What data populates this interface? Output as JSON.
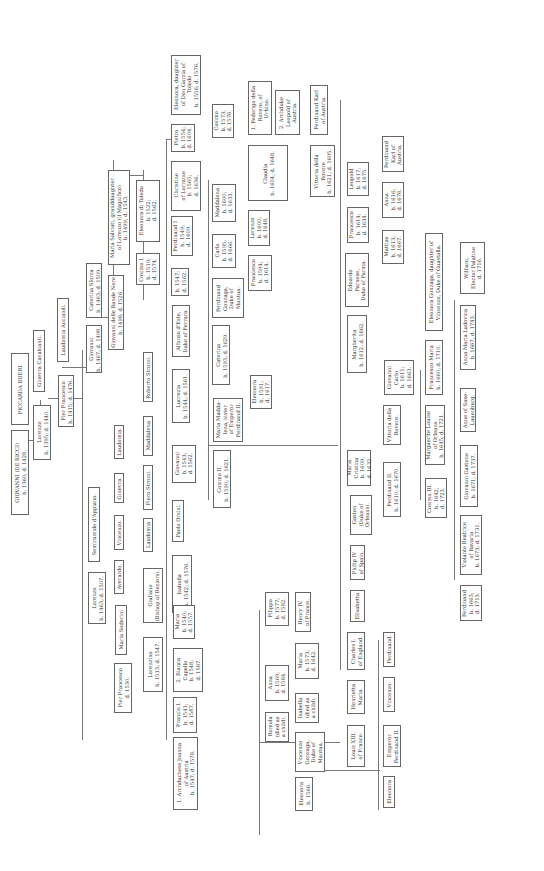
{
  "orientation": "rotated 90 degrees counter-clockwise (text reads bottom-to-top)",
  "persons": [
    {
      "id": "giovanni_bicci",
      "text": "GIOVANNI (DE BICCI)\nb. 1360; d. 1428."
    },
    {
      "id": "piccarda",
      "text": "PICCARDA BUERI."
    },
    {
      "id": "lorenzo_1395",
      "text": "Lorenzo\nb. 1395; d. 1440."
    },
    {
      "id": "ginevra_cavalcanti",
      "text": "Ginevra Cavalcanti."
    },
    {
      "id": "pier_francesco_1415",
      "text": "Pier Francesco\nb. 1415; d. 1476."
    },
    {
      "id": "laudomia_acciaioli",
      "text": "Laudomia Acciaioli."
    },
    {
      "id": "giovanni_1467",
      "text": "Giovanni\nb. 1467; d. 1498."
    },
    {
      "id": "caterina_sforza",
      "text": "Caterina Sforza\nb. 1463; d. 1509."
    },
    {
      "id": "giovanni_bande_nere",
      "text": "Giovanni delle Bande Nere\nb. 1498; d. 1526."
    },
    {
      "id": "maria_salviati",
      "text": "Maria Salviati, granddaughter\nof Lorenzo (il Magnifico)\nb. 1499; d. 1543."
    },
    {
      "id": "cosimo_1",
      "text": "Cosimo I.\nb. 1519;\nd. 1574."
    },
    {
      "id": "eleonora_toledo",
      "text": "Eleonora di Toledo\nb. 1522;\nd. 1562."
    },
    {
      "id": "child_1547",
      "text": "b. 1547;\nd. 1562."
    },
    {
      "id": "ferdinand_1",
      "text": "Ferdinand I\nb. 1549;\nd. 1609."
    },
    {
      "id": "christine_lorraine",
      "text": "Christine\nof Lorraine\nb. 1565;\nd. 1636."
    },
    {
      "id": "pietro",
      "text": "Pietro\nb. 1554;\nd. 1604."
    },
    {
      "id": "eleonora_garzia",
      "text": "Eleonora, daughter\nof Don Garzia of\nToledo\nb. 1556; d. 1576."
    },
    {
      "id": "cosimo_1573",
      "text": "Cosimo\nb. 1573;\nd. 1576."
    },
    {
      "id": "maddalena_1600",
      "text": "Maddalena\nb. 1600;\nd. 1633."
    },
    {
      "id": "claudia",
      "text": "Claudia\nb. 1604; d. 1648."
    },
    {
      "id": "federigo_rovere",
      "text": "1. Federigo della\nRovere, of\nUrbino."
    },
    {
      "id": "leopold_austria",
      "text": "2. Archduke\nLeopold of\nAustria."
    },
    {
      "id": "ferdinand_karl_1",
      "text": "Ferdinand Karl\nof Austria."
    },
    {
      "id": "vittoria_rovere_1621",
      "text": "Vittoria della\nRovere\nb. 1621; d. 1695."
    },
    {
      "id": "lorenzo_1600",
      "text": "Lorenzo\nb. 1600;\nd. 1648."
    },
    {
      "id": "carlo",
      "text": "Carlo\nb. 1595;\nd. 1666."
    },
    {
      "id": "francesco_1594",
      "text": "Francesco\nb. 1594;\nd. 1614."
    },
    {
      "id": "ferdinand_gonzaga",
      "text": "Ferdinand\nGonzaga,\nDuke of\nMantua."
    },
    {
      "id": "caterina_1593",
      "text": "Caterina\nb. 1593; d. 1629."
    },
    {
      "id": "eleonora_1591",
      "text": "Eleonora\nb. 1591;\nd. 1617."
    },
    {
      "id": "leopold_1617",
      "text": "Leopold\nb. 1617;\nd. 1675."
    },
    {
      "id": "francesco_1614",
      "text": "Francesco\nb. 1614;\nd. 1634."
    },
    {
      "id": "anna_1616",
      "text": "Anna\nb. 1616;\nd. 1676."
    },
    {
      "id": "ferdinand_karl_2",
      "text": "Ferdinand\nKarl of\nAustria."
    },
    {
      "id": "mattias",
      "text": "Mattias\nb. 1613;\nd. 1667."
    },
    {
      "id": "edoardo_farnese",
      "text": "Edoardo\nFarnese,\nDuke of Parma."
    },
    {
      "id": "margherita",
      "text": "Margherita\nb. 1612; d. 1662."
    },
    {
      "id": "giovanni_carlo",
      "text": "Giovanni\nCarlo\nb. 1611;\nd. 1663."
    },
    {
      "id": "francesco_maria",
      "text": "Francesco Maria\nb. 1660; d. 1710."
    },
    {
      "id": "eleonora_gonzaga",
      "text": "Eleonora Gonzaga, daughter of\nVincenzo, Duke of Guastalla."
    },
    {
      "id": "william_palatine",
      "text": "William,\nElector Palatine\nd. 1716."
    },
    {
      "id": "anna_maria_ludovica",
      "text": "Anna Maria Ludovica\nb. 1667; d. 1743."
    },
    {
      "id": "anne_saxe",
      "text": "Anne of Saxe-\nLauenburg."
    },
    {
      "id": "gian_gastone",
      "text": "Giovanni Gastone\nb. 1671; d. 1737."
    },
    {
      "id": "marguerite_orleans",
      "text": "Marguerite Louise\nof Orleans\nb. 1645; d. 1721."
    },
    {
      "id": "cosimo_3",
      "text": "Cosimo III.\nb. 1642;\nd. 1723."
    },
    {
      "id": "violante",
      "text": "Violante Beatrice\nof Bavaria\nb. 1673; d. 1731."
    },
    {
      "id": "ferdinand_1663",
      "text": "Ferdinand\nb. 1663;\nd. 1713."
    },
    {
      "id": "vittoria_rovere_2",
      "text": "Vittoria della\nRovere."
    },
    {
      "id": "ferdinand_2",
      "text": "Ferdinand II.\nb. 1610; d. 1670."
    },
    {
      "id": "maria_cristina",
      "text": "Maria\nCristina\nb. 1609;\nd. 1632."
    },
    {
      "id": "gaston",
      "text": "Gaston\n(Duke of\nOrleans)."
    },
    {
      "id": "philip_4",
      "text": "Philip IV\nof Spain."
    },
    {
      "id": "elisabetta",
      "text": "Elisabetta"
    },
    {
      "id": "charles_1",
      "text": "Charles I.\nof England."
    },
    {
      "id": "henrietta_maria",
      "text": "Henrietta\nMaria."
    },
    {
      "id": "louis_13",
      "text": "Louis XIII.\nof France."
    },
    {
      "id": "ferdinand_x",
      "text": "Ferdinand."
    },
    {
      "id": "vincenzo_x",
      "text": "Vincenzo."
    },
    {
      "id": "emperor_ferdinand_2",
      "text": "Emperor\nFerdinand II."
    },
    {
      "id": "eleonora_x",
      "text": "Eleonora"
    },
    {
      "id": "cosimo_2",
      "text": "Cosimo II.\nb. 1590; d. 1621."
    },
    {
      "id": "maria_maddalena",
      "text": "Maria Madda-\nlena, sister\nof Emperor\nFerdinand II."
    },
    {
      "id": "lucrezia",
      "text": "Lucrezia\nb. 1544; d. 1561."
    },
    {
      "id": "alfonso_este",
      "text": "Alfonso d'Este,\nDuke of Ferrara."
    },
    {
      "id": "giovanni_1543",
      "text": "Giovanni\nb. 1543;\nd. 1562."
    },
    {
      "id": "roberto_strozzi",
      "text": "Roberto Strozzi."
    },
    {
      "id": "maddalena",
      "text": "Maddalena"
    },
    {
      "id": "piero_strozzi",
      "text": "Piero Strozzi."
    },
    {
      "id": "laudomia_1",
      "text": "Laudomia"
    },
    {
      "id": "paolo_orsini",
      "text": "Paolo Orsini."
    },
    {
      "id": "isabella_1542",
      "text": "Isabella\nb. 1542; d. 1576."
    },
    {
      "id": "laudomia_2",
      "text": "Laudomia."
    },
    {
      "id": "ginevra",
      "text": "Ginevra."
    },
    {
      "id": "vincenzo",
      "text": "Vincenzo."
    },
    {
      "id": "averardo",
      "text": "Averardo."
    },
    {
      "id": "semiramide",
      "text": "Semiramide d'Appiano."
    },
    {
      "id": "lorenzo_1463",
      "text": "Lorenzo\nb. 1463; d. 1507."
    },
    {
      "id": "giuliano",
      "text": "Giuliano\n(Bishop of Beziers)."
    },
    {
      "id": "maria_soderini",
      "text": "Maria Soderini"
    },
    {
      "id": "pier_francesco_1530",
      "text": "Pier Francesco\nd. 1530."
    },
    {
      "id": "lorenzino",
      "text": "Lorenzino\nb. 1513; d. 1547."
    },
    {
      "id": "maria_1540",
      "text": "Maria\nb. 1540;\nd. 1557."
    },
    {
      "id": "bianca_capello",
      "text": "2. Bianca\nCapello\nb. 1548;\nd. 1587."
    },
    {
      "id": "francis_1",
      "text": "Francis I.\nb. 1541;\nd. 1587."
    },
    {
      "id": "joanna_austria",
      "text": "1. Archduchess Joanna\nof Austria\nb. 1547; d. 1578."
    },
    {
      "id": "filippo",
      "text": "Filippo\nb. 1577;\nd. 1582."
    },
    {
      "id": "henry_4",
      "text": "Henry IV.\nof France."
    },
    {
      "id": "marie",
      "text": "Maria\nb. 1573;\nd. 1642."
    },
    {
      "id": "anna_1569",
      "text": "Anna\nb. 1569;\nd. 1584."
    },
    {
      "id": "isabella_child",
      "text": "Isabella\n(died as\na child)."
    },
    {
      "id": "romola",
      "text": "Romola\n(died as\na child)."
    },
    {
      "id": "vincenzo_gonzaga",
      "text": "Vincenzo\nGonzaga,\nDuke of\nMantua."
    },
    {
      "id": "eleonora_1566",
      "text": "Eleonora\nb. 1566."
    }
  ]
}
